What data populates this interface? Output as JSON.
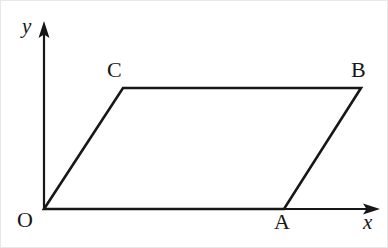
{
  "figure": {
    "kind": "geometry-diagram",
    "width": 388,
    "height": 248,
    "background_color": "#ffffff",
    "stroke_color": "#171717",
    "axis_stroke_width": 2.2,
    "shape_stroke_width": 2.6
  },
  "axes": {
    "origin": {
      "x": 43,
      "y": 208
    },
    "x_axis": {
      "label": "x",
      "from": {
        "x": 43,
        "y": 208
      },
      "to": {
        "x": 378,
        "y": 208
      },
      "arrowhead": "right"
    },
    "y_axis": {
      "label": "y",
      "from": {
        "x": 43,
        "y": 208
      },
      "to": {
        "x": 43,
        "y": 22
      },
      "arrowhead": "up"
    }
  },
  "polygon": {
    "name": "OABC",
    "closed": true,
    "vertices": [
      {
        "label": "O",
        "x": 43,
        "y": 208,
        "label_pos": "below-left"
      },
      {
        "label": "A",
        "x": 283,
        "y": 208,
        "label_pos": "below"
      },
      {
        "label": "B",
        "x": 360,
        "y": 87,
        "label_pos": "above"
      },
      {
        "label": "C",
        "x": 122,
        "y": 87,
        "label_pos": "above-left"
      }
    ],
    "edges": [
      {
        "from": "O",
        "to": "A"
      },
      {
        "from": "A",
        "to": "B"
      },
      {
        "from": "B",
        "to": "C"
      },
      {
        "from": "C",
        "to": "O"
      }
    ]
  },
  "labels": {
    "y_axis": "y",
    "x_axis": "x",
    "origin": "O",
    "vertex_a": "A",
    "vertex_b": "B",
    "vertex_c": "C"
  }
}
